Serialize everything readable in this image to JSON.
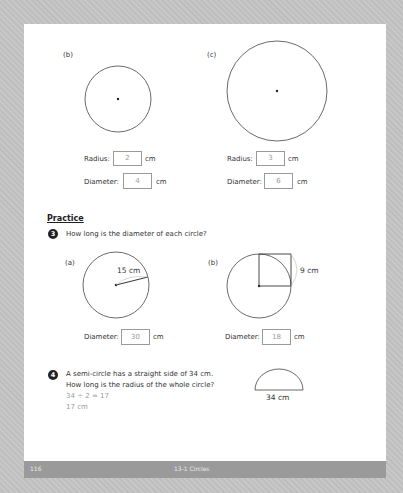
{
  "page": {
    "footer": {
      "page_number": "116",
      "chapter": "13-1 Circles"
    }
  },
  "examples": [
    {
      "label": "(b)",
      "radius_label": "Radius:",
      "radius_value": "2",
      "diameter_label": "Diameter:",
      "diameter_value": "4",
      "unit": "cm"
    },
    {
      "label": "(c)",
      "radius_label": "Radius:",
      "radius_value": "3",
      "diameter_label": "Diameter:",
      "diameter_value": "6",
      "unit": "cm"
    }
  ],
  "practice": {
    "heading": "Practice",
    "q3": {
      "number": "3",
      "text": "How long is the diameter of each circle?",
      "parts": [
        {
          "label": "(a)",
          "measure": "15 cm",
          "diameter_label": "Diameter:",
          "diameter_value": "30",
          "unit": "cm"
        },
        {
          "label": "(b)",
          "measure": "9 cm",
          "diameter_label": "Diameter:",
          "diameter_value": "18",
          "unit": "cm"
        }
      ]
    },
    "q4": {
      "number": "4",
      "text_line1": "A semi-circle has a straight side of 34 cm.",
      "text_line2": "How long is the radius of the whole circle?",
      "work_line1": "34 ÷ 2 = 17",
      "work_line2": "17 cm",
      "figure_label": "34 cm"
    }
  }
}
